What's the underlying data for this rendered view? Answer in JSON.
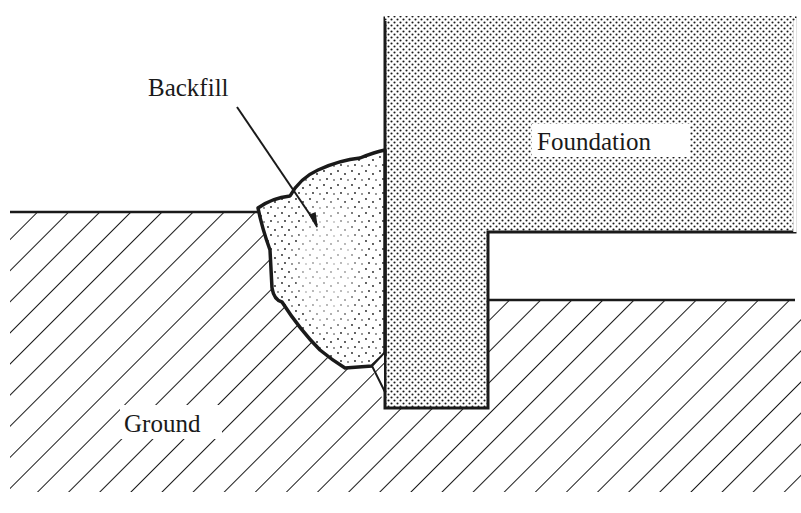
{
  "diagram": {
    "type": "cross-section",
    "labels": {
      "backfill": "Backfill",
      "foundation": "Foundation",
      "ground": "Ground"
    },
    "regions": [
      {
        "id": "foundation",
        "fill": "dotted-stipple",
        "shape": "inverted-L"
      },
      {
        "id": "backfill",
        "fill": "sparse-stipple",
        "shape": "irregular"
      },
      {
        "id": "ground",
        "fill": "diagonal-hatch",
        "shape": "stepped"
      }
    ],
    "annotation": {
      "type": "leader-arrow",
      "from": "Backfill label",
      "to": "backfill region"
    },
    "colors": {
      "ink": "#1a1a1a",
      "paper": "#ffffff"
    }
  }
}
